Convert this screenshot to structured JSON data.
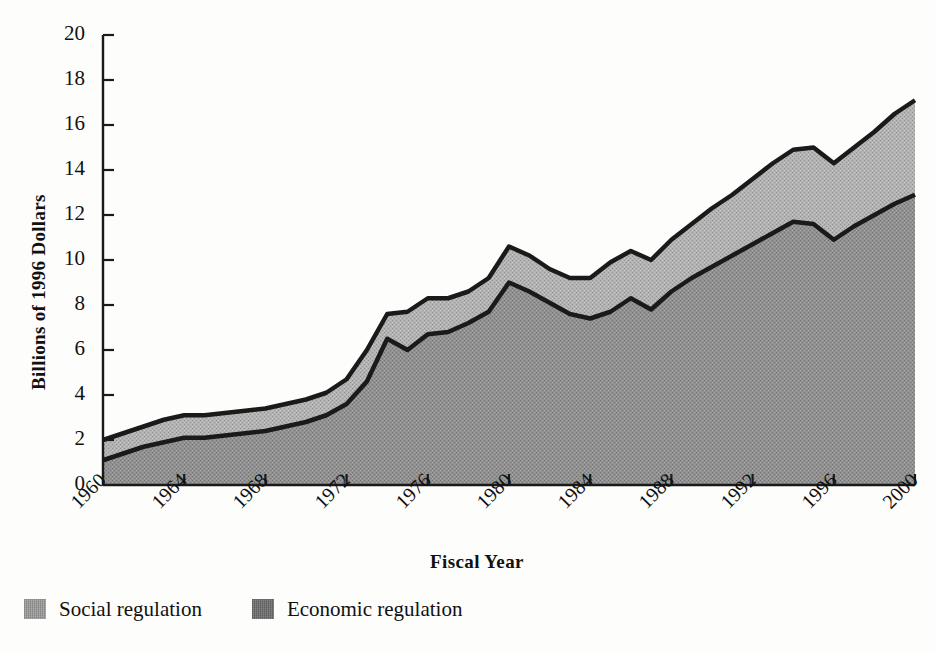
{
  "chart_data": {
    "type": "area",
    "title": "",
    "xlabel": "Fiscal Year",
    "ylabel": "Billions of 1996 Dollars",
    "xlim": [
      1960,
      2000
    ],
    "ylim": [
      0,
      20
    ],
    "grid": false,
    "stacked": true,
    "legend_position": "bottom-left",
    "xticks": [
      "1960",
      "1964",
      "1968",
      "1972",
      "1976",
      "1980",
      "1984",
      "1988",
      "1992",
      "1996",
      "2000"
    ],
    "yticks": [
      "0",
      "2",
      "4",
      "6",
      "8",
      "10",
      "12",
      "14",
      "16",
      "18",
      "20"
    ],
    "x": [
      1960,
      1961,
      1962,
      1963,
      1964,
      1965,
      1966,
      1967,
      1968,
      1969,
      1970,
      1971,
      1972,
      1973,
      1974,
      1975,
      1976,
      1977,
      1978,
      1979,
      1980,
      1981,
      1982,
      1983,
      1984,
      1985,
      1986,
      1987,
      1988,
      1989,
      1990,
      1991,
      1992,
      1993,
      1994,
      1995,
      1996,
      1997,
      1998,
      1999,
      2000
    ],
    "series": [
      {
        "name": "Economic regulation",
        "color": "#8d8d8d",
        "values": [
          1.1,
          1.4,
          1.7,
          1.9,
          2.1,
          2.1,
          2.2,
          2.3,
          2.4,
          2.6,
          2.8,
          3.1,
          3.6,
          4.6,
          6.5,
          6.0,
          6.7,
          6.8,
          7.2,
          7.7,
          9.0,
          8.6,
          8.1,
          7.6,
          7.4,
          7.7,
          8.3,
          7.8,
          8.6,
          9.2,
          9.7,
          10.2,
          10.7,
          11.2,
          11.7,
          11.6,
          10.9,
          11.5,
          12.0,
          12.5,
          12.9
        ]
      },
      {
        "name": "Social regulation",
        "color": "#a9a9a9",
        "values": [
          0.9,
          0.9,
          0.9,
          1.0,
          1.0,
          1.0,
          1.0,
          1.0,
          1.0,
          1.0,
          1.0,
          1.0,
          1.1,
          1.4,
          1.1,
          1.7,
          1.6,
          1.5,
          1.4,
          1.5,
          1.6,
          1.6,
          1.5,
          1.6,
          1.8,
          2.2,
          2.1,
          2.2,
          2.3,
          2.4,
          2.6,
          2.7,
          2.9,
          3.1,
          3.2,
          3.4,
          3.4,
          3.5,
          3.7,
          4.0,
          4.2
        ]
      }
    ],
    "totals": [
      2.0,
      2.3,
      2.6,
      2.9,
      3.1,
      3.1,
      3.2,
      3.3,
      3.4,
      3.6,
      3.8,
      4.1,
      4.7,
      6.0,
      7.6,
      7.7,
      8.3,
      8.3,
      8.6,
      9.2,
      10.6,
      10.2,
      9.6,
      9.2,
      9.2,
      9.9,
      10.4,
      10.0,
      10.9,
      11.6,
      12.3,
      12.9,
      13.6,
      14.3,
      14.9,
      15.0,
      14.3,
      15.0,
      15.7,
      16.5,
      17.1
    ]
  },
  "legend": {
    "items": [
      {
        "label": "Social regulation",
        "color": "#b0b0b0"
      },
      {
        "label": "Economic regulation",
        "color": "#909090"
      }
    ]
  },
  "colors": {
    "axis": "#1a1a1a",
    "line": "#1a1a1a",
    "background": "#fdfdfb",
    "social_fill": "#a9a9a9",
    "economic_fill": "#8d8d8d"
  }
}
